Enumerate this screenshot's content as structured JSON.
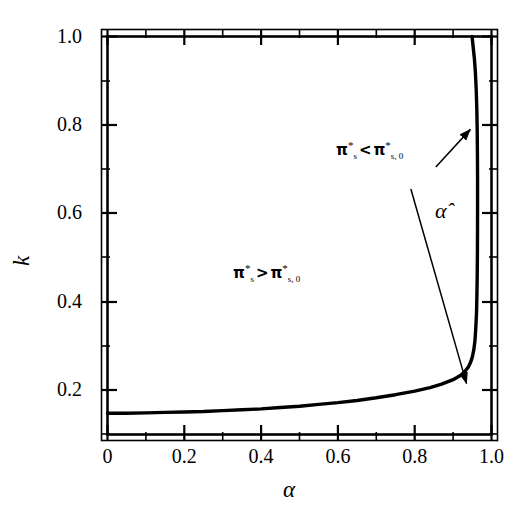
{
  "chart_data": {
    "type": "line",
    "title": "",
    "xlabel": "α",
    "ylabel": "k",
    "xlim": [
      0,
      1.0
    ],
    "ylim": [
      0.1,
      1.0
    ],
    "grid": false,
    "legend": "none",
    "x_ticks": [
      "0",
      "0.2",
      "0.4",
      "0.6",
      "0.8",
      "1.0"
    ],
    "x_tick_values": [
      0,
      0.2,
      0.4,
      0.6,
      0.8,
      1.0
    ],
    "x_minor_ticks": [
      0.1,
      0.3,
      0.5,
      0.7,
      0.9
    ],
    "y_ticks": [
      "0.2",
      "0.4",
      "0.6",
      "0.8",
      "1.0"
    ],
    "y_tick_values": [
      0.2,
      0.4,
      0.6,
      0.8,
      1.0
    ],
    "y_minor_ticks": [
      0.1,
      0.3,
      0.5,
      0.7,
      0.9
    ],
    "series": [
      {
        "name": "alpha-hat boundary",
        "points": [
          [
            0.0,
            0.148
          ],
          [
            0.05,
            0.148
          ],
          [
            0.1,
            0.149
          ],
          [
            0.15,
            0.15
          ],
          [
            0.2,
            0.151
          ],
          [
            0.25,
            0.152
          ],
          [
            0.3,
            0.154
          ],
          [
            0.35,
            0.156
          ],
          [
            0.4,
            0.158
          ],
          [
            0.45,
            0.161
          ],
          [
            0.5,
            0.164
          ],
          [
            0.55,
            0.168
          ],
          [
            0.6,
            0.172
          ],
          [
            0.65,
            0.177
          ],
          [
            0.7,
            0.183
          ],
          [
            0.75,
            0.19
          ],
          [
            0.8,
            0.198
          ],
          [
            0.84,
            0.206
          ],
          [
            0.87,
            0.214
          ],
          [
            0.9,
            0.224
          ],
          [
            0.92,
            0.234
          ],
          [
            0.93,
            0.242
          ],
          [
            0.94,
            0.253
          ],
          [
            0.945,
            0.262
          ],
          [
            0.95,
            0.275
          ],
          [
            0.954,
            0.292
          ],
          [
            0.957,
            0.313
          ],
          [
            0.959,
            0.34
          ],
          [
            0.961,
            0.375
          ],
          [
            0.962,
            0.415
          ],
          [
            0.9628,
            0.46
          ],
          [
            0.9633,
            0.51
          ],
          [
            0.9636,
            0.565
          ],
          [
            0.9637,
            0.62
          ],
          [
            0.9637,
            0.675
          ],
          [
            0.9634,
            0.73
          ],
          [
            0.9628,
            0.785
          ],
          [
            0.9618,
            0.835
          ],
          [
            0.9602,
            0.88
          ],
          [
            0.958,
            0.92
          ],
          [
            0.9552,
            0.952
          ],
          [
            0.952,
            0.978
          ],
          [
            0.9495,
            1.0
          ]
        ]
      }
    ],
    "annotations": [
      {
        "name": "region-label-upper",
        "text": "π*s < π*s,0",
        "x": 0.82,
        "y": 0.72
      },
      {
        "name": "region-label-lower",
        "text": "π*s > π*s,0",
        "x": 0.45,
        "y": 0.5
      },
      {
        "name": "curve-label",
        "text": "α̂",
        "x": 0.9,
        "y": 0.63
      }
    ],
    "arrows": [
      {
        "name": "arrow-upper-region",
        "from": [
          0.855,
          0.705
        ],
        "to": [
          0.945,
          0.79
        ]
      },
      {
        "name": "arrow-lower-region",
        "from": [
          0.79,
          0.655
        ],
        "to": [
          0.935,
          0.215
        ]
      }
    ]
  },
  "axes": {
    "y_label": "k",
    "x_label": "α",
    "y_tick_labels": [
      "1.0",
      "0.8",
      "0.6",
      "0.4",
      "0.2"
    ],
    "x_tick_labels": [
      "0",
      "0.2",
      "0.4",
      "0.6",
      "0.8",
      "1.0"
    ]
  },
  "labels": {
    "upper_pi": "π",
    "lower_pi": "π",
    "alpha_hat": "α̂",
    "less_than": "<",
    "greater_than": ">",
    "sub_s": "s",
    "sub_s0": "s, 0",
    "star": "*"
  },
  "colors": {
    "background": "#ffffff",
    "foreground": "#000000",
    "curve": "#000000"
  }
}
